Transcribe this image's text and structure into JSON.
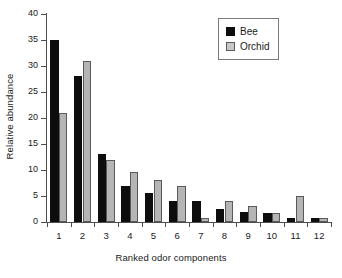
{
  "chart_data": {
    "type": "bar",
    "title": "",
    "subtitle": "",
    "xlabel": "Ranked odor components",
    "ylabel": "Relative abundance",
    "categories": [
      "1",
      "2",
      "3",
      "4",
      "5",
      "6",
      "7",
      "8",
      "9",
      "10",
      "11",
      "12"
    ],
    "series": [
      {
        "name": "Bee",
        "color": "#0d0d0d",
        "values": [
          35,
          28,
          13,
          7,
          5.5,
          4,
          4,
          2.5,
          1.9,
          1.8,
          0.8,
          0.8
        ]
      },
      {
        "name": "Orchid",
        "color": "#b5b5b5",
        "values": [
          21,
          31,
          12,
          9.6,
          8,
          7,
          0.8,
          4,
          3,
          1.8,
          5,
          0.8
        ]
      }
    ],
    "ylim": [
      0,
      40
    ],
    "ytick_labels": [
      "0",
      "5",
      "10",
      "15",
      "20",
      "25",
      "30",
      "35",
      "40"
    ],
    "ytick_values": [
      0,
      5,
      10,
      15,
      20,
      25,
      30,
      35,
      40
    ],
    "grid": false,
    "legend_position": "top-right",
    "legend_entries": [
      "Bee",
      "Orchid"
    ]
  }
}
